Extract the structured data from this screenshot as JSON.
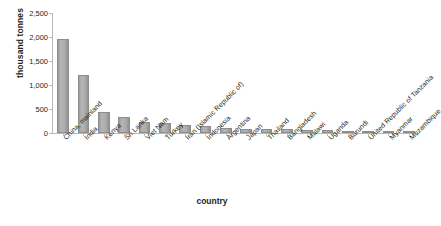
{
  "chart_data": {
    "type": "bar",
    "title": "",
    "xlabel": "country",
    "ylabel": "thousand tonnes",
    "ylim": [
      0,
      2500
    ],
    "yticks": [
      0,
      500,
      1000,
      1500,
      2000,
      2500
    ],
    "ytick_labels": [
      "0",
      "500",
      "1,000",
      "1,500",
      "2,000",
      "2,500"
    ],
    "grid": false,
    "legend": false,
    "bar_color": "#aeaeae",
    "axis_color": "#b8b8b8",
    "categories": [
      "China, mainland",
      "India",
      "Kenya",
      "Sri Lanka",
      "Viet Nam",
      "Turkey",
      "Iran (Islamic Republic of)",
      "Indonesia",
      "Argentina",
      "Japan",
      "Thailand",
      "Bangladesh",
      "Malawi",
      "Uganda",
      "Burundi",
      "United Republic of Tanzania",
      "Myanmar",
      "Mozambique"
    ],
    "values": [
      1950,
      1200,
      430,
      335,
      220,
      215,
      160,
      150,
      105,
      90,
      85,
      75,
      62,
      58,
      45,
      40,
      35,
      22
    ]
  }
}
